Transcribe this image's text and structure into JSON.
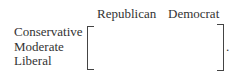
{
  "matrix": {
    "column_headers": [
      "Republican",
      "Democrat"
    ],
    "row_labels": [
      "Conservative",
      "Moderate",
      "Liberal"
    ],
    "cells": [
      [
        "",
        ""
      ],
      [
        "",
        ""
      ],
      [
        "",
        ""
      ]
    ],
    "trailing_punctuation": "."
  }
}
